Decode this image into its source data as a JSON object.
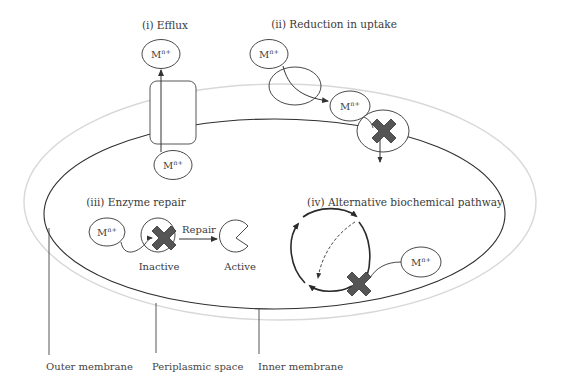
{
  "titles": {
    "efflux": "(i) Efflux",
    "reduction": "(ii) Reduction in uptake",
    "repair": "(iii) Enzyme repair",
    "pathway": "(iv) Alternative biochemical pathway"
  },
  "ion": {
    "base": "M",
    "charge": "n+"
  },
  "enzyme_repair": {
    "arrow_label": "Repair",
    "inactive_label": "Inactive",
    "active_label": "Active"
  },
  "legend": {
    "outer_membrane": "Outer membrane",
    "periplasmic_space": "Periplasmic space",
    "inner_membrane": "Inner membrane"
  },
  "colors": {
    "outer_membrane": "#d8d8d8",
    "inner_membrane": "#2f2f2f",
    "block_x": "#555555"
  }
}
